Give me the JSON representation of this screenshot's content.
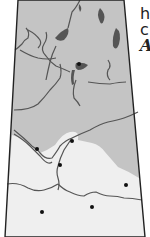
{
  "map": {
    "colors": {
      "shield_region": "#c4c4c4",
      "plains_region": "#efefef",
      "lakes": "#555555",
      "rivers": "#555555",
      "border": "#222222",
      "cities": "#111111"
    },
    "cities": [
      {
        "x": 79,
        "y": 64
      },
      {
        "x": 72,
        "y": 141
      },
      {
        "x": 37,
        "y": 149
      },
      {
        "x": 60,
        "y": 165
      },
      {
        "x": 126,
        "y": 185
      },
      {
        "x": 92,
        "y": 207
      },
      {
        "x": 42,
        "y": 212
      }
    ]
  },
  "side_text": {
    "line1": "h",
    "line2": "c",
    "line3": "A"
  }
}
